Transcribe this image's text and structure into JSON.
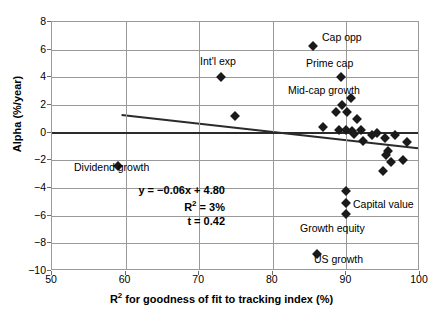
{
  "chart_data": {
    "type": "scatter",
    "title": "",
    "xlabel": "R² for goodness of fit to tracking index (%)",
    "ylabel": "Alpha (%/year)",
    "xlim": [
      50,
      100
    ],
    "ylim": [
      -10,
      8
    ],
    "xticks": [
      50,
      60,
      70,
      80,
      90,
      100
    ],
    "yticks": [
      8,
      6,
      4,
      2,
      0,
      -2,
      -4,
      -6,
      -8,
      -10
    ],
    "grid": true,
    "legend": "none",
    "zero_reference_line": 0,
    "points": [
      {
        "label": "Dividend growth",
        "x": 59.0,
        "y": -2.4
      },
      {
        "label": "Int'l exp",
        "x": 73.0,
        "y": 4.0
      },
      {
        "label": "",
        "x": 74.8,
        "y": 1.2
      },
      {
        "label": "Cap opp",
        "x": 85.5,
        "y": 6.3
      },
      {
        "label": "Prime cap",
        "x": 89.3,
        "y": 4.0
      },
      {
        "label": "Mid-cap growth",
        "x": 89.4,
        "y": 2.0
      },
      {
        "label": "",
        "x": 90.6,
        "y": 2.5
      },
      {
        "label": "",
        "x": 88.6,
        "y": 1.5
      },
      {
        "label": "",
        "x": 90.1,
        "y": 1.5
      },
      {
        "label": "",
        "x": 91.5,
        "y": 1.0
      },
      {
        "label": "",
        "x": 86.8,
        "y": 0.4
      },
      {
        "label": "",
        "x": 89.0,
        "y": 0.2
      },
      {
        "label": "",
        "x": 89.9,
        "y": 0.2
      },
      {
        "label": "",
        "x": 90.8,
        "y": 0.1
      },
      {
        "label": "",
        "x": 92.3,
        "y": -0.6
      },
      {
        "label": "",
        "x": 94.2,
        "y": 0.0
      },
      {
        "label": "",
        "x": 95.2,
        "y": -0.4
      },
      {
        "label": "",
        "x": 96.6,
        "y": -0.2
      },
      {
        "label": "",
        "x": 98.2,
        "y": -0.7
      },
      {
        "label": "",
        "x": 95.6,
        "y": -1.3
      },
      {
        "label": "",
        "x": 95.4,
        "y": -1.6
      },
      {
        "label": "",
        "x": 96.0,
        "y": -2.1
      },
      {
        "label": "",
        "x": 97.7,
        "y": -2.0
      },
      {
        "label": "",
        "x": 95.0,
        "y": -2.8
      },
      {
        "label": "",
        "x": 93.5,
        "y": -0.2
      },
      {
        "label": "",
        "x": 91.0,
        "y": -0.1
      },
      {
        "label": "",
        "x": 92.0,
        "y": 0.2
      },
      {
        "label": "Capital value",
        "x": 90.0,
        "y": -5.1
      },
      {
        "label": "Growth equity",
        "x": 90.0,
        "y": -5.9
      },
      {
        "label": "US growth",
        "x": 86.0,
        "y": -8.8
      },
      {
        "label": "",
        "x": 89.9,
        "y": -4.2
      }
    ],
    "trendline": {
      "equation": "y = −0.06x + 4.80",
      "r_squared_label": "R² = 3%",
      "t_label": "t = 0.42",
      "slope": -0.06,
      "intercept": 4.8,
      "x_start": 59.5,
      "x_end": 100.0
    },
    "annotations": [
      {
        "name": "cap-opp",
        "text": "Cap opp",
        "x_px": 322,
        "y_px": 31
      },
      {
        "name": "intl-exp",
        "text": "Int'l exp",
        "x_px": 200,
        "y_px": 55
      },
      {
        "name": "prime-cap",
        "text": "Prime cap",
        "x_px": 306,
        "y_px": 57
      },
      {
        "name": "mid-cap-growth",
        "text": "Mid-cap growth",
        "x_px": 288,
        "y_px": 84
      },
      {
        "name": "dividend-growth",
        "text": "Dividend growth",
        "x_px": 74,
        "y_px": 161
      },
      {
        "name": "capital-value",
        "text": "Capital value",
        "x_px": 353,
        "y_px": 198
      },
      {
        "name": "growth-equity",
        "text": "Growth equity",
        "x_px": 300,
        "y_px": 222
      },
      {
        "name": "us-growth",
        "text": "US growth",
        "x_px": 314,
        "y_px": 253
      }
    ]
  }
}
